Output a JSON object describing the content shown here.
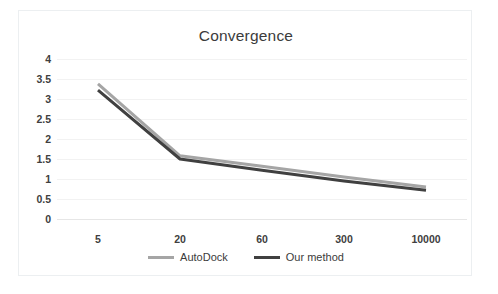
{
  "chart": {
    "title": "Convergence"
  },
  "legend": {
    "position": "bottom",
    "items": [
      {
        "label": "AutoDock",
        "color": "#A5A5A5"
      },
      {
        "label": "Our method",
        "color": "#404040"
      }
    ]
  },
  "chart_data": {
    "type": "line",
    "title": "Convergence",
    "xlabel": "",
    "ylabel": "",
    "categories": [
      "5",
      "20",
      "60",
      "300",
      "10000"
    ],
    "series": [
      {
        "name": "AutoDock",
        "color": "#A5A5A5",
        "values": [
          3.38,
          1.58,
          1.32,
          1.05,
          0.8
        ]
      },
      {
        "name": "Our method",
        "color": "#404040",
        "values": [
          3.22,
          1.5,
          1.22,
          0.95,
          0.72
        ]
      }
    ],
    "ylim": [
      0,
      4
    ],
    "yticks": [
      "0",
      "0.5",
      "1",
      "1.5",
      "2",
      "2.5",
      "3",
      "3.5",
      "4"
    ],
    "ytick_values": [
      0,
      0.5,
      1,
      1.5,
      2,
      2.5,
      3,
      3.5,
      4
    ],
    "grid": "horizontal",
    "legend_position": "bottom"
  }
}
